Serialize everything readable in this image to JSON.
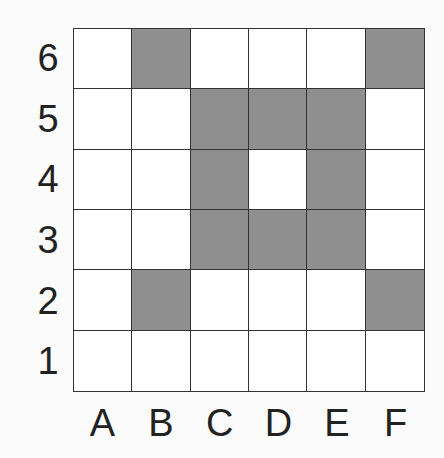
{
  "grid": {
    "rows": [
      "6",
      "5",
      "4",
      "3",
      "2",
      "1"
    ],
    "columns": [
      "A",
      "B",
      "C",
      "D",
      "E",
      "F"
    ],
    "fill_color": "#8f8f8f",
    "empty_color": "#ffffff",
    "filled_cells": [
      "B6",
      "F6",
      "C5",
      "D5",
      "E5",
      "C4",
      "E4",
      "C3",
      "D3",
      "E3",
      "B2",
      "F2"
    ],
    "matrix": [
      [
        0,
        1,
        0,
        0,
        0,
        1
      ],
      [
        0,
        0,
        1,
        1,
        1,
        0
      ],
      [
        0,
        0,
        1,
        0,
        1,
        0
      ],
      [
        0,
        0,
        1,
        1,
        1,
        0
      ],
      [
        0,
        1,
        0,
        0,
        0,
        1
      ],
      [
        0,
        0,
        0,
        0,
        0,
        0
      ]
    ]
  }
}
